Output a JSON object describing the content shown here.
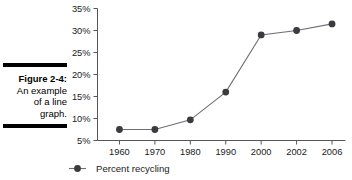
{
  "caption": {
    "label": "Figure 2-4:",
    "lines": [
      "An example",
      "of a line",
      "graph."
    ]
  },
  "colors": {
    "marker": "#3a3a3f",
    "line": "#6e6e75",
    "axis": "#55555a",
    "text": "#1a1a1a",
    "rule": "#000000"
  },
  "chart_data": {
    "type": "line",
    "title": "",
    "xlabel": "",
    "ylabel": "",
    "categories": [
      "1960",
      "1970",
      "1980",
      "1990",
      "2000",
      "2002",
      "2006"
    ],
    "values": [
      7.5,
      7.5,
      9.7,
      16.0,
      29.0,
      30.0,
      31.5
    ],
    "series": [
      {
        "name": "Percent recycling",
        "values": [
          7.5,
          7.5,
          9.7,
          16.0,
          29.0,
          30.0,
          31.5
        ]
      }
    ],
    "ylim": [
      5,
      35
    ],
    "ytick_values": [
      5,
      10,
      15,
      20,
      25,
      30,
      35
    ],
    "ytick_labels": [
      "5%",
      "10%",
      "15%",
      "20%",
      "25%",
      "30%",
      "35%"
    ],
    "grid": false,
    "legend": [
      "Percent recycling"
    ],
    "legend_position": "bottom-left",
    "marker": "circle"
  }
}
